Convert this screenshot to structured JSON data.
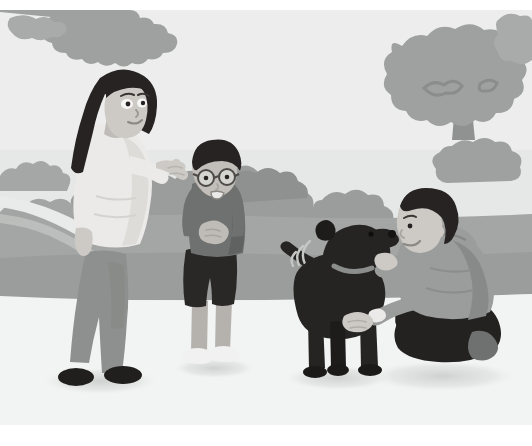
{
  "image": {
    "title": "Park scene illustration: family greeting a dog",
    "kind": "flat-vector cartoon illustration",
    "width": 532,
    "height": 446,
    "has_text": false,
    "frame": {
      "top_margin_px": 10,
      "bottom_margin_px": 22,
      "page_background": "#ffffff"
    }
  },
  "palette": {
    "sky": "#eceeed",
    "sky_low": "#e3e6e5",
    "tree_canopy_dark": "#9a9d9b",
    "tree_canopy_mid": "#a9acaa",
    "tree_canopy_light": "#b5b8b6",
    "tree_trunk": "#8f9290",
    "bush_mid": "#9fa2a0",
    "bush_dark": "#8e918f",
    "midground_grass": "#a2a5a3",
    "midground_grass_dark": "#959896",
    "path_light": "#e8eae9",
    "foreground_ground": "#f2f4f3",
    "foreground_shadow": "#dadcdb",
    "skin_light": "#d6d3cf",
    "skin_mid": "#c4c1bd",
    "skin_shadow": "#b2afab",
    "hair_black": "#241f1f",
    "hair_dark": "#2e2a2a",
    "shirt_white": "#ececea",
    "shirt_white_shade": "#dcdcd9",
    "pants_grey": "#8d908e",
    "pants_grey_shade": "#7f827f",
    "shoe_black": "#22201f",
    "boy_shirt": "#6e716f",
    "boy_shirt_shade": "#5f6260",
    "boy_collar": "#e6e8e7",
    "boy_shorts": "#2a2827",
    "boy_shoe_white": "#f0f1f0",
    "man_hoodie": "#9a9d9b",
    "man_hoodie_shade": "#878a88",
    "man_pants_black": "#232221",
    "dog_black": "#262423",
    "dog_black_shade": "#1b1a19",
    "collar_grey": "#8a8d8b",
    "motion_line": "#c9ccca",
    "outline": "#5a5d5b"
  },
  "scene": {
    "setting": "public park on an overcast day",
    "horizon_y": 300,
    "layers": [
      {
        "name": "sky",
        "description": "pale grey-white sky filling the upper half"
      },
      {
        "name": "background-trees",
        "description": "grey leafy tree canopies at top-left and top-right with a visible trunk on the right"
      },
      {
        "name": "midground-bushes",
        "description": "row of rounded shrubs across the middle of the frame"
      },
      {
        "name": "path",
        "description": "light curving footpath entering from the left edge"
      },
      {
        "name": "midground-grass",
        "description": "medium grey lawn band"
      },
      {
        "name": "foreground-ground",
        "description": "very light pale ground plane with soft cast shadows"
      }
    ]
  },
  "characters": [
    {
      "id": "woman",
      "label": "Woman",
      "position": "left",
      "pose": "standing, leaning slightly forward, right arm extended forward with open hand in a cautioning or calming gesture",
      "expression": "calm, attentive, slight smile, looking toward the dog",
      "hair": "long dark hair tied back in a low ponytail",
      "clothing": {
        "top": "loose short-sleeved off-white tee",
        "bottom": "grey tapered trousers",
        "shoes": "black flat shoes"
      },
      "bbox": [
        52,
        62,
        155,
        390
      ]
    },
    {
      "id": "boy",
      "label": "Boy",
      "position": "center",
      "pose": "standing still, hands clasped together in front of chest, body turned toward the dog",
      "expression": "nervous but curious, mouth slightly open",
      "accessory": "round eyeglasses",
      "hair": "short dark hair",
      "clothing": {
        "top": "grey short-sleeved t-shirt with white crew collar",
        "bottom": "dark navy shorts",
        "shoes": "white sneakers"
      },
      "bbox": [
        178,
        158,
        250,
        372
      ]
    },
    {
      "id": "man",
      "label": "Man",
      "position": "right",
      "pose": "kneeling on one knee, leaning toward the dog, one hand under the dog's chin and the other arm around the dog's chest",
      "expression": "smiling warmly at the dog",
      "hair": "short dark wavy hair",
      "clothing": {
        "top": "grey hooded sweatshirt",
        "bottom": "black trousers",
        "shoes": "dark shoe sole visible at right"
      },
      "bbox": [
        355,
        196,
        505,
        390
      ]
    },
    {
      "id": "dog",
      "label": "Dog",
      "position": "center-right",
      "breed_look": "black labrador-type dog",
      "pose": "standing on all four legs facing the kneeling man, head tilted up, tail wagging",
      "details": [
        "grey collar around neck",
        "curved motion lines beside the tail indicating wagging"
      ],
      "bbox": [
        290,
        228,
        395,
        385
      ]
    }
  ],
  "annotations": {
    "motion_marks": {
      "name": "tail-wag-lines",
      "count": 3,
      "location": "left of the dog's raised tail",
      "color": "#c9ccca"
    },
    "shadows": [
      {
        "owner": "woman",
        "type": "soft elliptical ground shadow"
      },
      {
        "owner": "boy",
        "type": "soft elliptical ground shadow"
      },
      {
        "owner": "dog",
        "type": "soft elliptical ground shadow"
      },
      {
        "owner": "man",
        "type": "soft elliptical ground shadow"
      }
    ]
  }
}
